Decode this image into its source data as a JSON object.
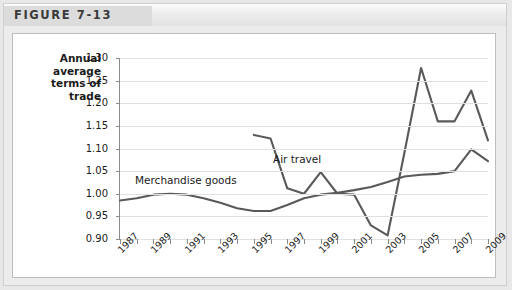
{
  "figure": {
    "title": "FIGURE 7-13"
  },
  "axes": {
    "y_title_lines": [
      "Annual",
      "average",
      "terms of",
      "trade"
    ],
    "y_ticks": [
      "0.90",
      "0.95",
      "1.00",
      "1.05",
      "1.10",
      "1.15",
      "1.20",
      "1.25",
      "1.30"
    ],
    "x_ticks": [
      "1987",
      "1989",
      "1991",
      "1993",
      "1995",
      "1997",
      "1999",
      "2001",
      "2003",
      "2005",
      "2007",
      "2009"
    ]
  },
  "colors": {
    "line": "#595959",
    "grid": "#e0e0e0",
    "axis": "#8a8a8a",
    "card": "#ffffff",
    "page": "#ececec",
    "header_band": "#dcdcdc",
    "text": "#1b1b1b"
  },
  "chart_data": {
    "type": "line",
    "title": "FIGURE 7-13",
    "xlabel": "",
    "ylabel": "Annual average terms of trade",
    "ylim": [
      0.9,
      1.3
    ],
    "ytick_step": 0.05,
    "xlim": [
      1987,
      2009
    ],
    "grid": true,
    "legend": "inline-labels",
    "x": [
      1987,
      1988,
      1989,
      1990,
      1991,
      1992,
      1993,
      1994,
      1995,
      1996,
      1997,
      1998,
      1999,
      2000,
      2001,
      2002,
      2003,
      2004,
      2005,
      2006,
      2007,
      2008,
      2009
    ],
    "series": [
      {
        "name": "Merchandise goods",
        "label_position": "left-center",
        "x": [
          1987,
          1988,
          1989,
          1990,
          1991,
          1992,
          1993,
          1994,
          1995,
          1996,
          1997,
          1998,
          1999,
          2000,
          2001,
          2002,
          2003,
          2004,
          2005,
          2006,
          2007,
          2008,
          2009
        ],
        "values": [
          0.985,
          0.99,
          0.998,
          1.0,
          0.998,
          0.99,
          0.98,
          0.968,
          0.962,
          0.962,
          0.975,
          0.99,
          0.998,
          1.002,
          1.008,
          1.015,
          1.026,
          1.038,
          1.042,
          1.044,
          1.05,
          1.098,
          1.072
        ]
      },
      {
        "name": "Air travel",
        "label_position": "above-1997",
        "x": [
          1995,
          1996,
          1997,
          1998,
          1999,
          2000,
          2001,
          2002,
          2003,
          2004,
          2005,
          2006,
          2007,
          2008,
          2009
        ],
        "values": [
          1.13,
          1.122,
          1.012,
          1.0,
          1.048,
          1.0,
          0.998,
          0.93,
          0.908,
          1.09,
          1.278,
          1.16,
          1.16,
          1.228,
          1.118
        ]
      }
    ]
  }
}
